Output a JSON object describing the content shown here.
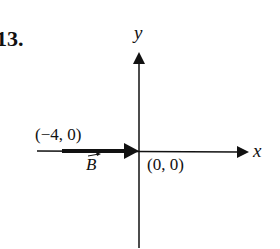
{
  "problem": {
    "number": "13."
  },
  "axes": {
    "x_label": "x",
    "y_label": "y"
  },
  "vector": {
    "name": "B",
    "start_label": "(−4, 0)",
    "end_label": "(0, 0)",
    "start": [
      -4,
      0
    ],
    "end": [
      0,
      0
    ]
  },
  "colors": {
    "ink": "#111111",
    "background": "#ffffff"
  }
}
